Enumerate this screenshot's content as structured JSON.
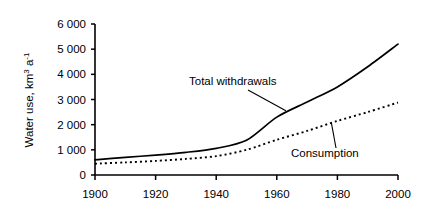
{
  "chart_data": {
    "type": "line",
    "title": "",
    "xlabel": "",
    "ylabel": "Water use, km3 a-1",
    "ylabel_parts": {
      "base1": "Water use, km",
      "sup1": "3",
      "base2": " a",
      "sup2": "-1"
    },
    "xlim": [
      1900,
      2000
    ],
    "ylim": [
      0,
      6000
    ],
    "grid": false,
    "legend_position": "inline-annotations",
    "x_ticks": [
      1900,
      1920,
      1940,
      1960,
      1980,
      2000
    ],
    "x_tick_labels": [
      "1900",
      "1920",
      "1940",
      "1960",
      "1980",
      "2000"
    ],
    "y_ticks": [
      0,
      1000,
      2000,
      3000,
      4000,
      5000,
      6000
    ],
    "y_tick_labels": [
      "0",
      "1 000",
      "2 000",
      "3 000",
      "4 000",
      "5 000",
      "6 000"
    ],
    "x": [
      1900,
      1910,
      1920,
      1930,
      1940,
      1950,
      1960,
      1970,
      1980,
      1990,
      2000
    ],
    "series": [
      {
        "name": "Total withdrawals",
        "style": "solid",
        "color": "#000000",
        "values": [
          600,
          700,
          790,
          900,
          1060,
          1380,
          2300,
          2900,
          3500,
          4300,
          5200
        ]
      },
      {
        "name": "Consumption",
        "style": "dotted",
        "color": "#000000",
        "values": [
          450,
          500,
          560,
          640,
          750,
          1000,
          1400,
          1750,
          2150,
          2500,
          2880
        ]
      }
    ],
    "annotations": [
      {
        "text": "Total withdrawals",
        "target_x": 1963,
        "target_y": 2550,
        "leader": true
      },
      {
        "text": "Consumption",
        "target_x": 1978,
        "target_y": 2080,
        "leader": true
      }
    ]
  }
}
